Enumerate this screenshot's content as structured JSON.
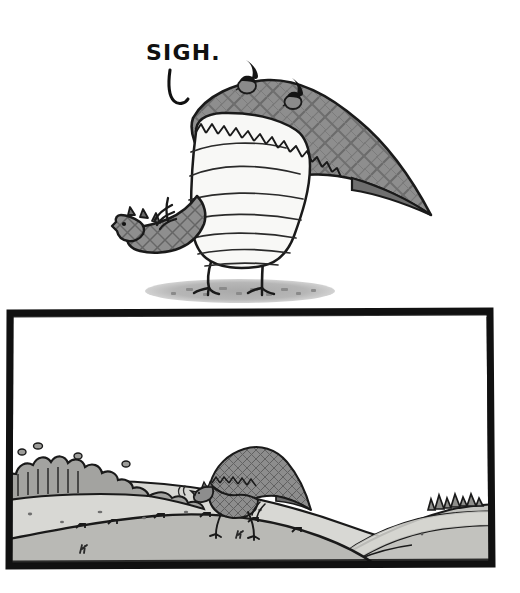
{
  "comic": {
    "title": "Sigh Dragon Two-Panel Comic",
    "medium": "pen-and-ink cartoon with gray wash",
    "panel_count": 2
  },
  "panels": [
    {
      "id": "panel-top",
      "name": "close-up-dragon-panel",
      "border": "none",
      "background": "#ffffff",
      "dialogue": {
        "text": "SIGH.",
        "style": "hand-lettered capitals",
        "tail": "hooked speech-balloon tail curving down and right"
      },
      "subjects": [
        {
          "name": "large-dragon",
          "description": "Large plaid-textured dragon standing in profile, head small and lowered at far left, enormous folded wing sweeping up and right into a long tapering tail, pale striped belly bulging forward, two thin bird legs with clawed feet",
          "mood": "weary, slumped, sighing"
        },
        {
          "name": "perched-bird-left",
          "description": "Small dark bird with upswept tail feather perched on the dragon's back ridge"
        },
        {
          "name": "perched-bird-right",
          "description": "Second small dark bird with upswept tail feather perched further along the back ridge"
        },
        {
          "name": "ground-shadow",
          "description": "Flat elliptical gray shadow speckled with dark dashes beneath the dragon's feet"
        }
      ]
    },
    {
      "id": "panel-bottom",
      "name": "wide-landscape-panel",
      "border": "thick irregular hand-drawn black rectangle",
      "background": "#ffffff",
      "subjects": [
        {
          "name": "small-dragon",
          "description": "The same dragon seen far away, small and plaid-shaded, walking leftward along the crest of a hill with tail trailing behind",
          "mood": "solitary, trudging"
        },
        {
          "name": "left-hedge",
          "description": "Dark gray scalloped hedge of bushes with vertical hatch strokes along the upper left ridge"
        },
        {
          "name": "right-bushes",
          "description": "Cluster of small scribbled bush tufts on the distant right ridge"
        },
        {
          "name": "near-hill",
          "description": "Broad medium-gray foreground hill filling the lower third"
        },
        {
          "name": "far-hill",
          "description": "Lighter gray midground hill the dragon walks upon"
        },
        {
          "name": "valley-basin",
          "description": "Nested contour curves forming a light gray valley bowl at lower right"
        },
        {
          "name": "sky",
          "description": "Empty white sky occupying the upper half of the panel"
        }
      ]
    }
  ],
  "palette": {
    "ink": "#111111",
    "paper": "#ffffff",
    "belly": "#f7f7f5",
    "body_gray": "#8e8e8e",
    "plaid_line": "#5f5f5f",
    "shadow_gray": "#b4b4b4",
    "hill_light": "#d6d6d2",
    "hill_mid": "#b9b9b5",
    "hill_dark": "#9a9a96",
    "hedge_gray": "#a2a2a0"
  }
}
